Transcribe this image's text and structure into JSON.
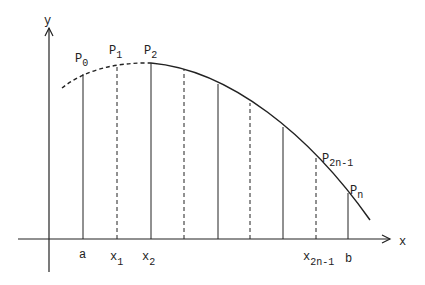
{
  "diagram": {
    "type": "simpson-rule-partition",
    "axes": {
      "x_label": "x",
      "y_label": "y"
    },
    "curve": {
      "dashed_segment": "before P2",
      "solid_segment": "from P2 to beyond Pn"
    },
    "points": [
      {
        "base": "P",
        "sub": "0"
      },
      {
        "base": "P",
        "sub": "1"
      },
      {
        "base": "P",
        "sub": "2"
      },
      {
        "base": "P",
        "sub": "2n-1"
      },
      {
        "base": "P",
        "sub": "n"
      }
    ],
    "x_ticks": [
      {
        "base": "a",
        "sub": ""
      },
      {
        "base": "x",
        "sub": "1"
      },
      {
        "base": "x",
        "sub": "2"
      },
      {
        "base": "x",
        "sub": "2n-1"
      },
      {
        "base": "b",
        "sub": ""
      }
    ],
    "ordinates": [
      {
        "x": 83,
        "style": "solid"
      },
      {
        "x": 117,
        "style": "dashed"
      },
      {
        "x": 151,
        "style": "solid"
      },
      {
        "x": 184,
        "style": "dashed"
      },
      {
        "x": 218,
        "style": "solid"
      },
      {
        "x": 250,
        "style": "dashed"
      },
      {
        "x": 283,
        "style": "solid"
      },
      {
        "x": 316,
        "style": "dashed"
      },
      {
        "x": 348,
        "style": "solid"
      }
    ]
  }
}
